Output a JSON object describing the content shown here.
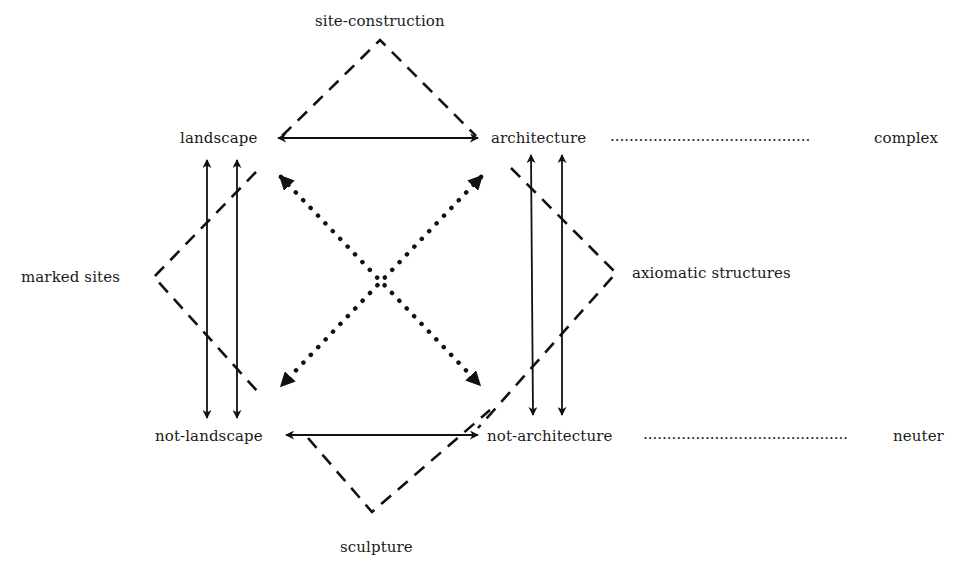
{
  "diagram": {
    "type": "expanded-field-klein-group",
    "nodes": {
      "site_construction": "site-construction",
      "landscape": "landscape",
      "architecture": "architecture",
      "complex": "complex",
      "marked_sites": "marked sites",
      "axiomatic_structures": "axiomatic structures",
      "not_landscape": "not-landscape",
      "not_architecture": "not-architecture",
      "neuter": "neuter",
      "sculpture": "sculpture"
    },
    "leaders": {
      "top": "..........................................",
      "bottom": "..........................................."
    },
    "edges": [
      {
        "from": "landscape",
        "to": "architecture",
        "style": "solid",
        "arrows": "both"
      },
      {
        "from": "not-landscape",
        "to": "not-architecture",
        "style": "solid",
        "arrows": "both"
      },
      {
        "from": "landscape",
        "to": "not-landscape",
        "style": "solid",
        "arrows": "both",
        "count": 2
      },
      {
        "from": "architecture",
        "to": "not-architecture",
        "style": "solid",
        "arrows": "both",
        "count": 2
      },
      {
        "from": "landscape",
        "to": "not-architecture",
        "style": "dotted",
        "arrows": "both"
      },
      {
        "from": "architecture",
        "to": "not-landscape",
        "style": "dotted",
        "arrows": "both"
      },
      {
        "from": "site-construction",
        "to": [
          "landscape",
          "architecture"
        ],
        "style": "dashed"
      },
      {
        "from": "marked sites",
        "to": [
          "landscape",
          "not-landscape"
        ],
        "style": "dashed"
      },
      {
        "from": "axiomatic structures",
        "to": [
          "architecture",
          "not-architecture"
        ],
        "style": "dashed"
      },
      {
        "from": "sculpture",
        "to": [
          "not-landscape",
          "not-architecture"
        ],
        "style": "dashed"
      },
      {
        "from": "architecture",
        "to": "complex",
        "style": "dotted-leader"
      },
      {
        "from": "not-architecture",
        "to": "neuter",
        "style": "dotted-leader"
      }
    ],
    "colors": {
      "ink": "#111111",
      "background": "#ffffff"
    }
  }
}
